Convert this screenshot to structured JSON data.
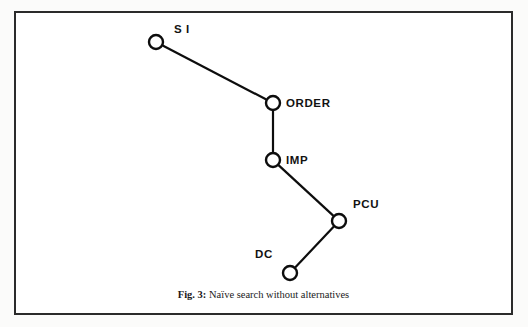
{
  "figure": {
    "frame_color": "#2b2b2b",
    "background_color": "#ffffff",
    "caption": {
      "number": "Fig. 3:",
      "text": "Naïve search without alternatives",
      "full": "Fig. 3: Naïve search without alternatives"
    }
  },
  "chart_data": {
    "type": "diagram-tree",
    "title": "Fig. 3: Naïve search without alternatives",
    "node_style": {
      "shape": "circle",
      "radius": 7,
      "fill": "#ffffff",
      "stroke": "#0d0d0d",
      "stroke_width": 2.4
    },
    "edge_style": {
      "stroke": "#0d0d0d",
      "stroke_width": 2.2
    },
    "nodes": [
      {
        "id": "si",
        "label": "S I",
        "x": 140,
        "y": 29,
        "label_dx": 18,
        "label_dy": -18
      },
      {
        "id": "order",
        "label": "ORDER",
        "x": 257,
        "y": 90,
        "label_dx": 13,
        "label_dy": -5
      },
      {
        "id": "imp",
        "label": "IMP",
        "x": 257,
        "y": 147,
        "label_dx": 13,
        "label_dy": -5
      },
      {
        "id": "pcu",
        "label": "PCU",
        "x": 323,
        "y": 208,
        "label_dx": 14,
        "label_dy": -22
      },
      {
        "id": "dc",
        "label": "DC",
        "x": 274,
        "y": 260,
        "label_dx": -35,
        "label_dy": -24
      }
    ],
    "edges": [
      {
        "from": "si",
        "to": "order"
      },
      {
        "from": "order",
        "to": "imp"
      },
      {
        "from": "imp",
        "to": "pcu"
      },
      {
        "from": "pcu",
        "to": "dc"
      }
    ],
    "axis": {
      "grid": false,
      "xlabel": "",
      "ylabel": ""
    },
    "legend": {
      "entries": [],
      "position": "none"
    }
  }
}
